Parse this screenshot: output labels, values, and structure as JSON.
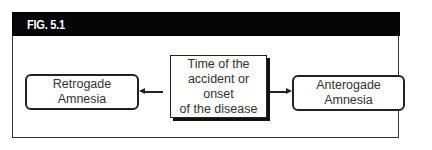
{
  "figure": {
    "label": "FIG. 5.1",
    "header_color": "#050505"
  },
  "diagram": {
    "nodes": [
      {
        "id": "left",
        "label_lines": [
          "Retrogade",
          "Amnesia"
        ],
        "shape": "rounded-rect"
      },
      {
        "id": "center",
        "label_lines": [
          "Time of the",
          "accident or onset",
          "of the disease"
        ],
        "shape": "rect-with-shadow"
      },
      {
        "id": "right",
        "label_lines": [
          "Anterogade Amnesia"
        ],
        "shape": "rounded-rect"
      }
    ],
    "edges": [
      {
        "from": "center",
        "to": "left",
        "style": "arrow"
      },
      {
        "from": "center",
        "to": "right",
        "style": "arrow"
      }
    ]
  }
}
